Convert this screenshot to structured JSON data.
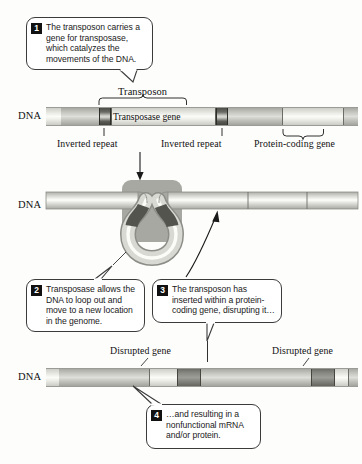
{
  "figure": {
    "background_color": "#fdfdfc"
  },
  "callouts": [
    {
      "number": "1",
      "text": "The transposon carries a gene for transposase, which catalyzes the movements of the DNA."
    },
    {
      "number": "2",
      "text": "Transposase allows the DNA to loop out and move to a new location in the genome."
    },
    {
      "number": "3",
      "text": "The transposon has inserted within a protein-coding gene, disrupting it…"
    },
    {
      "number": "4",
      "text": "…and resulting in a nonfunctional mRNA and/or protein."
    }
  ],
  "panels": {
    "top": {
      "dna_label": "DNA",
      "bracket_label": "Transposon",
      "gene_label": "Transposase gene",
      "annotations": [
        "Inverted repeat",
        "Inverted repeat",
        "Protein-coding gene"
      ]
    },
    "middle": {
      "dna_label": "DNA"
    },
    "bottom": {
      "dna_label": "DNA",
      "annotations": [
        "Disrupted gene",
        "Disrupted gene"
      ]
    }
  },
  "colors": {
    "dna_light": "#e6e6e1",
    "dna_mid": "#c6c6c0",
    "dna_dark": "#8a8a85",
    "inverted_repeat": "#4e4e49",
    "enzyme": "#a8a8a2",
    "outline": "#3b3b3b",
    "callout_number_bg": "#111111"
  }
}
